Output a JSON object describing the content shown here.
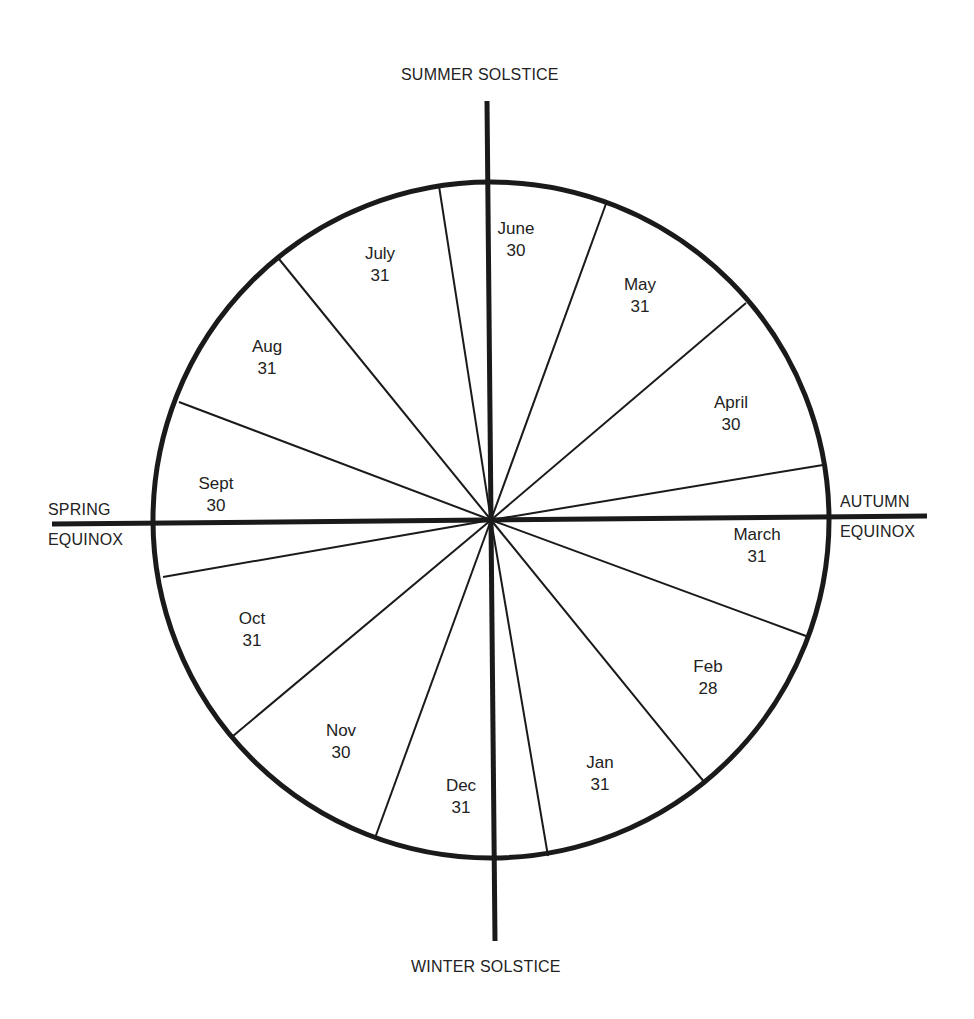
{
  "diagram": {
    "title": "",
    "center": {
      "x": 491,
      "y": 520
    },
    "radius": 338,
    "axes": {
      "top_label": "SUMMER SOLSTICE",
      "bottom_label": "WINTER SOLSTICE",
      "left_label_line1": "SPRING",
      "left_label_line2": "EQUINOX",
      "right_label_line1": "AUTUMN",
      "right_label_line2": "EQUINOX"
    },
    "months": [
      {
        "name": "June",
        "days": "30",
        "x": 516,
        "y": 218
      },
      {
        "name": "May",
        "days": "31",
        "x": 640,
        "y": 274
      },
      {
        "name": "April",
        "days": "30",
        "x": 731,
        "y": 392
      },
      {
        "name": "March",
        "days": "31",
        "x": 757,
        "y": 524
      },
      {
        "name": "Feb",
        "days": "28",
        "x": 708,
        "y": 656
      },
      {
        "name": "Jan",
        "days": "31",
        "x": 600,
        "y": 752
      },
      {
        "name": "Dec",
        "days": "31",
        "x": 461,
        "y": 775
      },
      {
        "name": "Nov",
        "days": "30",
        "x": 341,
        "y": 720
      },
      {
        "name": "Oct",
        "days": "31",
        "x": 252,
        "y": 608
      },
      {
        "name": "Sept",
        "days": "30",
        "x": 216,
        "y": 473
      },
      {
        "name": "Aug",
        "days": "31",
        "x": 267,
        "y": 336
      },
      {
        "name": "July",
        "days": "31",
        "x": 380,
        "y": 243
      }
    ],
    "spoke_endpoints": [
      [
        607,
        201
      ],
      [
        746,
        303
      ],
      [
        823,
        465
      ],
      [
        806,
        636
      ],
      [
        705,
        783
      ],
      [
        548,
        856
      ],
      [
        375,
        838
      ],
      [
        233,
        736
      ],
      [
        163,
        577
      ],
      [
        179,
        402
      ],
      [
        279,
        259
      ],
      [
        439,
        186
      ]
    ],
    "colors": {
      "stroke": "#1a1a1a",
      "background": "#ffffff"
    }
  }
}
